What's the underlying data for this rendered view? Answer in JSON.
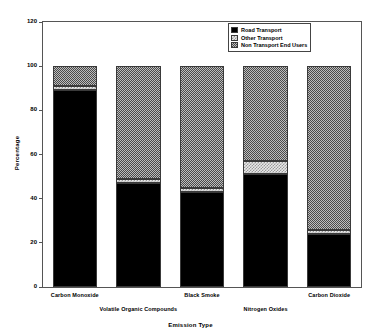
{
  "chart_data": {
    "type": "bar",
    "subtype": "stacked-bar",
    "title": "",
    "xlabel": "Emission Type",
    "ylabel": "Percentage",
    "ylim": [
      0,
      120
    ],
    "yticks": [
      0,
      20,
      40,
      60,
      80,
      100,
      120
    ],
    "grid": false,
    "legend_position": "top-right",
    "categories": [
      "Carbon Monoxide",
      "Volatile Organic Compounds",
      "Black Smoke",
      "Nitrogen Oxides",
      "Carbon Dioxide"
    ],
    "series": [
      {
        "name": "Road Transport",
        "fill": "solid-black",
        "values": [
          89,
          47,
          43,
          51,
          24
        ]
      },
      {
        "name": "Other Transport",
        "fill": "light-checker",
        "values": [
          2,
          2,
          2,
          6,
          2
        ]
      },
      {
        "name": "Non Transport End Users",
        "fill": "medium-checker",
        "values": [
          9,
          51,
          55,
          43,
          74
        ]
      }
    ],
    "totals": [
      100,
      100,
      100,
      100,
      100
    ]
  },
  "axes": {
    "y": {
      "label": "Percentage",
      "ticks": [
        "0",
        "20",
        "40",
        "60",
        "80",
        "100",
        "120"
      ]
    },
    "x": {
      "label": "Emission Type",
      "ticks": [
        {
          "label": "Carbon Monoxide",
          "row": 0
        },
        {
          "label": "Volatile Organic Compounds",
          "row": 1
        },
        {
          "label": "Black Smoke",
          "row": 0
        },
        {
          "label": "Nitrogen Oxides",
          "row": 1
        },
        {
          "label": "Carbon Dioxide",
          "row": 0
        }
      ]
    }
  },
  "legend": {
    "entries": [
      {
        "label": "Road Transport",
        "swatch": "solid-black"
      },
      {
        "label": "Other Transport",
        "swatch": "light-checker"
      },
      {
        "label": "Non Transport End Users",
        "swatch": "medium-checker"
      }
    ]
  },
  "colors": {
    "series_road_transport": "#000000",
    "series_other_transport": "#e9e9e9",
    "series_non_transport": "#bdbdbd",
    "frame": "#555555",
    "background": "#ffffff"
  }
}
